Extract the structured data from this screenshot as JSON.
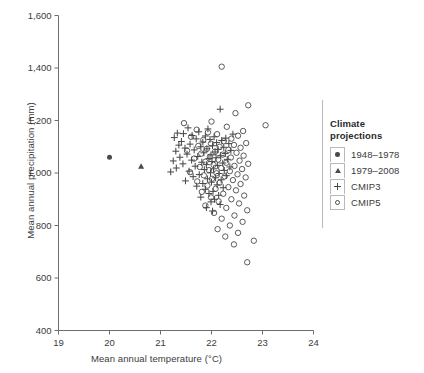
{
  "chart_data": {
    "type": "scatter",
    "title": "",
    "xlabel": "Mean annual temperature (°C)",
    "ylabel": "Mean annual precipitation (mm)",
    "xlim": [
      19,
      24
    ],
    "ylim": [
      400,
      1600
    ],
    "xticks": [
      "19",
      "20",
      "21",
      "22",
      "23",
      "24"
    ],
    "xtick_values": [
      19,
      20,
      21,
      22,
      23,
      24
    ],
    "yticks": [
      "400",
      "600",
      "800",
      "1,000",
      "1,200",
      "1,400",
      "1,600"
    ],
    "ytick_values": [
      400,
      600,
      800,
      1000,
      1200,
      1400,
      1600
    ],
    "grid": false,
    "legend_position": "right",
    "marker_color": "#4a4a4a",
    "series": [
      {
        "name": "1948–1978",
        "marker": "filled-circle",
        "points": [
          [
            20.0,
            1060
          ]
        ]
      },
      {
        "name": "1979–2008",
        "marker": "filled-triangle",
        "points": [
          [
            20.62,
            1025
          ]
        ]
      },
      {
        "name": "CMIP3",
        "marker": "plus",
        "points": [
          [
            22.17,
            1243
          ],
          [
            21.54,
            1172
          ],
          [
            21.93,
            1168
          ],
          [
            21.75,
            1157
          ],
          [
            21.33,
            1152
          ],
          [
            21.45,
            1150
          ],
          [
            22.42,
            1148
          ],
          [
            21.62,
            1143
          ],
          [
            21.88,
            1141
          ],
          [
            22.05,
            1138
          ],
          [
            21.27,
            1135
          ],
          [
            22.28,
            1133
          ],
          [
            21.7,
            1130
          ],
          [
            21.97,
            1128
          ],
          [
            22.2,
            1124
          ],
          [
            21.41,
            1120
          ],
          [
            21.83,
            1118
          ],
          [
            22.1,
            1116
          ],
          [
            22.34,
            1112
          ],
          [
            21.58,
            1110
          ],
          [
            21.36,
            1106
          ],
          [
            22.02,
            1104
          ],
          [
            21.79,
            1100
          ],
          [
            22.24,
            1098
          ],
          [
            21.48,
            1095
          ],
          [
            21.91,
            1092
          ],
          [
            22.13,
            1090
          ],
          [
            21.66,
            1088
          ],
          [
            22.38,
            1086
          ],
          [
            21.3,
            1083
          ],
          [
            22.07,
            1080
          ],
          [
            21.85,
            1077
          ],
          [
            22.27,
            1074
          ],
          [
            21.52,
            1072
          ],
          [
            21.99,
            1069
          ],
          [
            22.18,
            1066
          ],
          [
            21.73,
            1063
          ],
          [
            21.38,
            1060
          ],
          [
            22.09,
            1058
          ],
          [
            21.95,
            1055
          ],
          [
            22.31,
            1052
          ],
          [
            21.61,
            1049
          ],
          [
            21.25,
            1046
          ],
          [
            22.01,
            1044
          ],
          [
            21.81,
            1041
          ],
          [
            22.22,
            1038
          ],
          [
            21.44,
            1035
          ],
          [
            21.9,
            1032
          ],
          [
            22.12,
            1029
          ],
          [
            21.68,
            1026
          ],
          [
            22.36,
            1023
          ],
          [
            21.31,
            1019
          ],
          [
            22.04,
            1016
          ],
          [
            21.86,
            1013
          ],
          [
            22.25,
            1010
          ],
          [
            21.56,
            1007
          ],
          [
            21.2,
            1004
          ],
          [
            21.98,
            1001
          ],
          [
            22.15,
            998
          ],
          [
            21.76,
            994
          ],
          [
            22.29,
            990
          ],
          [
            21.64,
            986
          ],
          [
            22.08,
            982
          ],
          [
            21.92,
            978
          ],
          [
            22.19,
            974
          ],
          [
            21.49,
            970
          ],
          [
            22.0,
            965
          ],
          [
            21.83,
            960
          ],
          [
            22.11,
            955
          ],
          [
            21.71,
            950
          ],
          [
            22.23,
            944
          ],
          [
            21.88,
            938
          ],
          [
            22.03,
            930
          ],
          [
            21.95,
            922
          ],
          [
            22.14,
            915
          ],
          [
            21.79,
            908
          ],
          [
            22.06,
            900
          ],
          [
            21.99,
            890
          ],
          [
            22.17,
            880
          ],
          [
            21.9,
            868
          ],
          [
            22.02,
            855
          ]
        ]
      },
      {
        "name": "CMIP5",
        "marker": "open-circle",
        "points": [
          [
            22.2,
            1405
          ],
          [
            22.72,
            1258
          ],
          [
            23.06,
            1182
          ],
          [
            22.47,
            1228
          ],
          [
            21.46,
            1190
          ],
          [
            22.0,
            1196
          ],
          [
            22.62,
            1160
          ],
          [
            21.71,
            1165
          ],
          [
            22.3,
            1176
          ],
          [
            21.93,
            1155
          ],
          [
            22.52,
            1142
          ],
          [
            22.11,
            1148
          ],
          [
            21.6,
            1138
          ],
          [
            22.39,
            1131
          ],
          [
            21.84,
            1126
          ],
          [
            22.24,
            1121
          ],
          [
            22.68,
            1114
          ],
          [
            21.99,
            1112
          ],
          [
            22.44,
            1107
          ],
          [
            21.74,
            1103
          ],
          [
            22.16,
            1100
          ],
          [
            22.57,
            1096
          ],
          [
            21.91,
            1092
          ],
          [
            22.33,
            1088
          ],
          [
            21.52,
            1085
          ],
          [
            22.07,
            1081
          ],
          [
            22.49,
            1077
          ],
          [
            21.8,
            1074
          ],
          [
            22.22,
            1070
          ],
          [
            22.63,
            1066
          ],
          [
            21.97,
            1062
          ],
          [
            22.38,
            1059
          ],
          [
            21.66,
            1055
          ],
          [
            22.13,
            1051
          ],
          [
            22.55,
            1047
          ],
          [
            21.88,
            1043
          ],
          [
            22.29,
            1039
          ],
          [
            22.72,
            1035
          ],
          [
            22.04,
            1031
          ],
          [
            22.45,
            1027
          ],
          [
            21.77,
            1023
          ],
          [
            22.19,
            1019
          ],
          [
            22.6,
            1015
          ],
          [
            21.95,
            1011
          ],
          [
            22.36,
            1007
          ],
          [
            21.58,
            1003
          ],
          [
            22.1,
            999
          ],
          [
            22.51,
            995
          ],
          [
            21.85,
            991
          ],
          [
            22.26,
            987
          ],
          [
            22.67,
            983
          ],
          [
            22.01,
            978
          ],
          [
            22.42,
            973
          ],
          [
            21.72,
            968
          ],
          [
            22.16,
            963
          ],
          [
            22.57,
            958
          ],
          [
            21.92,
            952
          ],
          [
            22.33,
            946
          ],
          [
            22.08,
            940
          ],
          [
            22.48,
            934
          ],
          [
            21.81,
            928
          ],
          [
            22.23,
            921
          ],
          [
            22.64,
            914
          ],
          [
            21.99,
            907
          ],
          [
            22.39,
            900
          ],
          [
            22.14,
            892
          ],
          [
            22.54,
            884
          ],
          [
            21.88,
            876
          ],
          [
            22.29,
            867
          ],
          [
            22.7,
            858
          ],
          [
            22.05,
            848
          ],
          [
            22.45,
            838
          ],
          [
            22.2,
            826
          ],
          [
            22.61,
            814
          ],
          [
            22.36,
            800
          ],
          [
            22.12,
            786
          ],
          [
            22.52,
            772
          ],
          [
            22.27,
            758
          ],
          [
            22.83,
            742
          ],
          [
            22.44,
            728
          ],
          [
            22.7,
            660
          ]
        ]
      }
    ]
  },
  "legend": {
    "title_line1": "Climate",
    "title_line2": "projections",
    "items": [
      {
        "label": "1948–1978",
        "marker": "filled-circle"
      },
      {
        "label": "1979–2008",
        "marker": "filled-triangle"
      },
      {
        "label": "CMIP3",
        "marker": "plus"
      },
      {
        "label": "CMIP5",
        "marker": "open-circle"
      }
    ]
  }
}
